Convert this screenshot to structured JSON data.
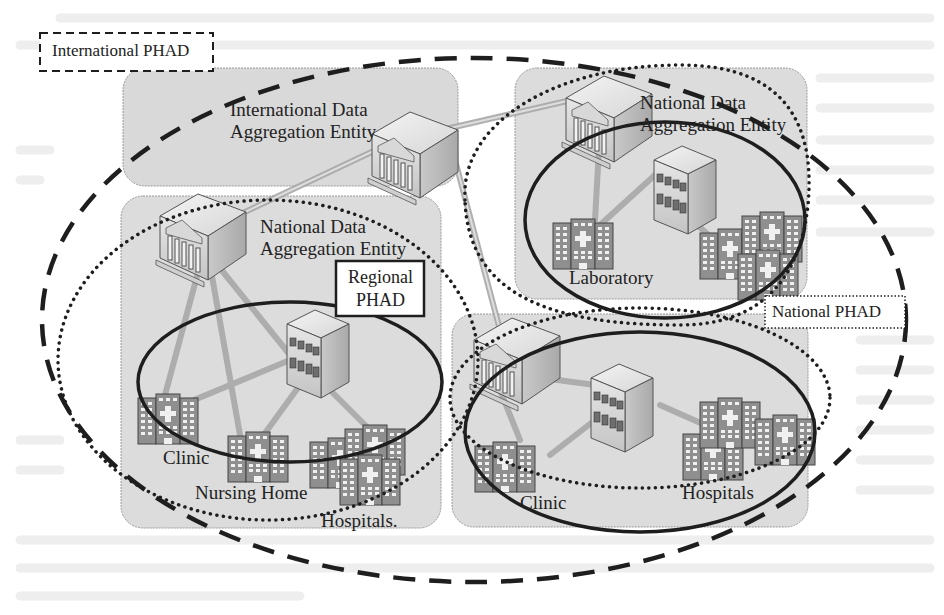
{
  "diagram": {
    "legend": {
      "international_phad": "International PHAD",
      "national_phad": "National PHAD",
      "regional_phad_line1": "Regional",
      "regional_phad_line2": "PHAD"
    },
    "panels": {
      "international": {
        "title_line1": "International Data",
        "title_line2": "Aggregation Entity"
      },
      "national_left": {
        "title_line1": "National Data",
        "title_line2": "Aggregation Entity",
        "nodes": [
          "Clinic",
          "Nursing Home",
          "Hospitals."
        ]
      },
      "national_right": {
        "title_line1": "National Data",
        "title_line2": "Aggregation Entity",
        "nodes": [
          "Laboratory"
        ]
      },
      "regional_bottom_right": {
        "nodes": [
          "Clinic",
          "Hospitals"
        ]
      }
    },
    "boundary_styles": {
      "international_phad": "dashed",
      "national_phad": "dotted",
      "regional_phad": "solid"
    },
    "colors": {
      "panel_fill": "#dcdcdc",
      "stroke": "#1e1e1e",
      "link": "#bdbdbd",
      "background": "#ffffff"
    }
  }
}
